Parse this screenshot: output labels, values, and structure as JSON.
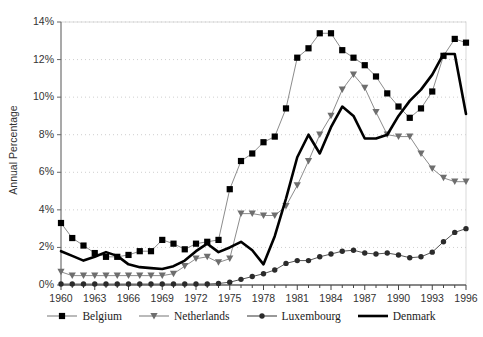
{
  "chart_data": {
    "type": "line",
    "title": "",
    "xlabel": "",
    "ylabel": "Annual Percentage",
    "xlim": [
      1960,
      1996
    ],
    "ylim": [
      0,
      14
    ],
    "ytick_labels": [
      "0%",
      "2%",
      "4%",
      "6%",
      "8%",
      "10%",
      "12%",
      "14%"
    ],
    "ytick_values": [
      0,
      2,
      4,
      6,
      8,
      10,
      12,
      14
    ],
    "xtick_labels": [
      "1960",
      "1963",
      "1966",
      "1969",
      "1972",
      "1975",
      "1978",
      "1981",
      "1984",
      "1987",
      "1990",
      "1993",
      "1996"
    ],
    "xtick_values": [
      1960,
      1963,
      1966,
      1969,
      1972,
      1975,
      1978,
      1981,
      1984,
      1987,
      1990,
      1993,
      1996
    ],
    "grid": "horizontal-dotted",
    "legend_position": "bottom",
    "x": [
      1960,
      1961,
      1962,
      1963,
      1964,
      1965,
      1966,
      1967,
      1968,
      1969,
      1970,
      1971,
      1972,
      1973,
      1974,
      1975,
      1976,
      1977,
      1978,
      1979,
      1980,
      1981,
      1982,
      1983,
      1984,
      1985,
      1986,
      1987,
      1988,
      1989,
      1990,
      1991,
      1992,
      1993,
      1994,
      1995,
      1996
    ],
    "series": [
      {
        "name": "Belgium",
        "marker": "square",
        "line_color": "#8c8c8c",
        "marker_color": "#000000",
        "values": [
          3.3,
          2.5,
          2.1,
          1.7,
          1.5,
          1.5,
          1.6,
          1.8,
          1.8,
          2.4,
          2.2,
          1.9,
          2.2,
          2.3,
          2.4,
          5.1,
          6.6,
          7.0,
          7.6,
          7.9,
          9.4,
          12.1,
          12.6,
          13.4,
          13.4,
          12.5,
          12.1,
          11.7,
          11.1,
          10.2,
          9.5,
          8.9,
          9.4,
          10.3,
          12.2,
          13.1,
          12.9
        ]
      },
      {
        "name": "Netherlands",
        "marker": "triangle-down",
        "line_color": "#8c8c8c",
        "marker_color": "#6e6e6e",
        "values": [
          0.7,
          0.5,
          0.5,
          0.5,
          0.5,
          0.5,
          0.5,
          0.5,
          0.5,
          0.5,
          0.6,
          1.0,
          1.4,
          1.5,
          1.2,
          1.4,
          3.8,
          3.8,
          3.7,
          3.7,
          4.2,
          5.3,
          6.6,
          8.0,
          9.0,
          10.4,
          11.2,
          10.5,
          9.2,
          8.0,
          7.9,
          7.9,
          7.0,
          6.2,
          5.7,
          5.5,
          5.5
        ]
      },
      {
        "name": "Luxembourg",
        "marker": "circle",
        "line_color": "#555555",
        "marker_color": "#2b2b2b",
        "values": [
          0.05,
          0.05,
          0.05,
          0.05,
          0.05,
          0.05,
          0.05,
          0.05,
          0.05,
          0.05,
          0.05,
          0.05,
          0.05,
          0.05,
          0.08,
          0.15,
          0.3,
          0.45,
          0.6,
          0.8,
          1.15,
          1.3,
          1.3,
          1.5,
          1.65,
          1.8,
          1.85,
          1.7,
          1.65,
          1.7,
          1.6,
          1.45,
          1.5,
          1.75,
          2.3,
          2.8,
          3.0
        ]
      },
      {
        "name": "Denmark",
        "marker": "none",
        "line_color": "#000000",
        "marker_color": "#000000",
        "values": [
          1.8,
          1.55,
          1.3,
          1.5,
          1.75,
          1.55,
          1.1,
          0.95,
          0.9,
          0.85,
          1.0,
          1.3,
          1.8,
          2.2,
          1.75,
          2.0,
          2.3,
          1.85,
          1.1,
          2.6,
          4.6,
          6.8,
          8.0,
          7.0,
          8.4,
          9.5,
          9.0,
          7.8,
          7.8,
          8.0,
          9.0,
          9.8,
          10.4,
          11.2,
          12.3,
          12.3,
          9.1
        ]
      }
    ]
  },
  "legend": {
    "items": [
      {
        "label": "Belgium"
      },
      {
        "label": "Netherlands"
      },
      {
        "label": "Luxembourg"
      },
      {
        "label": "Denmark"
      }
    ]
  }
}
